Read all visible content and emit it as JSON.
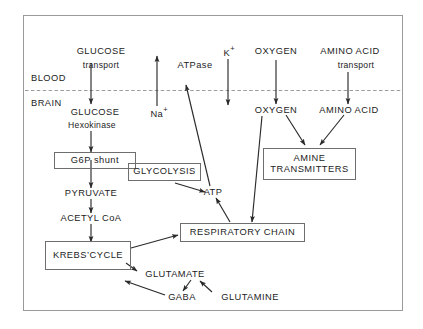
{
  "figure": {
    "frame_color": "#8a8a8a",
    "line_color": "#2a2a2a",
    "background": "#ffffff"
  },
  "compartments": {
    "blood_label": "BLOOD",
    "brain_label": "BRAIN",
    "barrier_style": "dotted"
  },
  "blood_side": {
    "glucose_transport_line1": "GLUCOSE",
    "glucose_transport_line2": "transport",
    "atpase": "ATPase",
    "potassium": "K",
    "potassium_charge": "+",
    "oxygen": "OXYGEN",
    "amino_acid_line1": "AMINO ACID",
    "amino_acid_line2": "transport"
  },
  "brain_side": {
    "glucose": "GLUCOSE",
    "hexokinase": "Hexokinase",
    "sodium": "Na",
    "sodium_charge": "+",
    "oxygen": "OXYGEN",
    "amino_acid": "AMINO ACID",
    "pyruvate": "PYRUVATE",
    "acetyl_coa": "ACETYL CoA",
    "atp": "ATP",
    "glutamate": "GLUTAMATE",
    "gaba": "GABA",
    "glutamine": "GLUTAMINE"
  },
  "boxes": {
    "g6p_shunt": "G6P  shunt",
    "glycolysis": "GLYCOLYSIS",
    "amine_transmitters_line1": "AMINE",
    "amine_transmitters_line2": "TRANSMITTERS",
    "respiratory_chain": "RESPIRATORY  CHAIN",
    "krebs_cycle": "KREBS’CYCLE"
  }
}
